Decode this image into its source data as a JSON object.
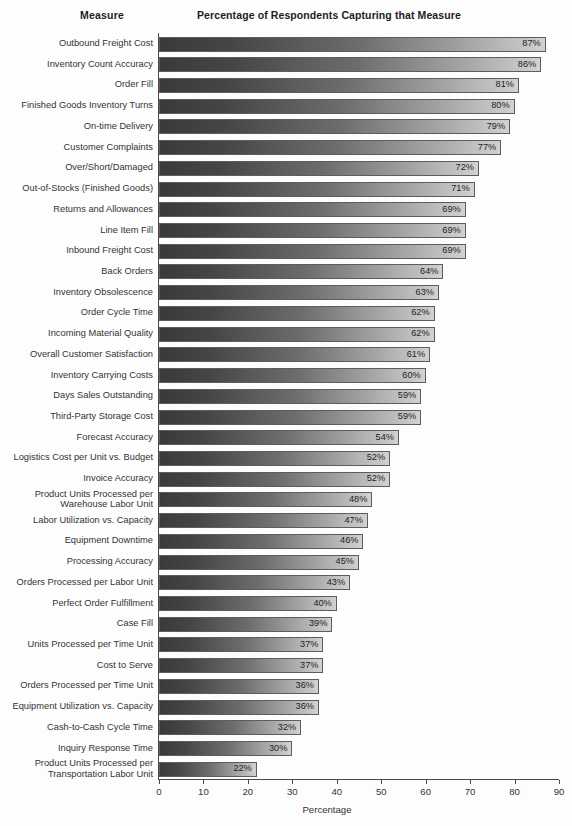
{
  "headers": {
    "measure": "Measure",
    "percentage": "Percentage of Respondents Capturing that Measure"
  },
  "chart_data": {
    "type": "bar",
    "orientation": "horizontal",
    "title": "Percentage of Respondents Capturing that Measure",
    "xlabel": "Percentage",
    "ylabel": "Measure",
    "xlim": [
      0,
      90
    ],
    "xticks": [
      0,
      10,
      20,
      30,
      40,
      50,
      60,
      70,
      80,
      90
    ],
    "grid": false,
    "legend": null,
    "value_suffix": "%",
    "bar_gradient": [
      "#3a3a3a",
      "#d2d2d2"
    ],
    "bar_border": "#5d5d5d",
    "categories": [
      "Outbound Freight Cost",
      "Inventory Count Accuracy",
      "Order Fill",
      "Finished Goods Inventory Turns",
      "On-time Delivery",
      "Customer Complaints",
      "Over/Short/Damaged",
      "Out-of-Stocks (Finished Goods)",
      "Returns and Allowances",
      "Line Item Fill",
      "Inbound Freight Cost",
      "Back Orders",
      "Inventory Obsolescence",
      "Order Cycle Time",
      "Incoming Material Quality",
      "Overall Customer Satisfaction",
      "Inventory Carrying Costs",
      "Days Sales Outstanding",
      "Third-Party Storage Cost",
      "Forecast Accuracy",
      "Logistics Cost per Unit vs. Budget",
      "Invoice Accuracy",
      "Product Units Processed per\nWarehouse Labor Unit",
      "Labor Utilization vs. Capacity",
      "Equipment Downtime",
      "Processing Accuracy",
      "Orders Processed per Labor Unit",
      "Perfect Order Fulfillment",
      "Case Fill",
      "Units Processed per Time Unit",
      "Cost to Serve",
      "Orders Processed per Time  Unit",
      "Equipment Utilization vs. Capacity",
      "Cash-to-Cash Cycle Time",
      "Inquiry Response Time",
      "Product Units Processed per\nTransportation Labor Unit"
    ],
    "values": [
      87,
      86,
      81,
      80,
      79,
      77,
      72,
      71,
      69,
      69,
      69,
      64,
      63,
      62,
      62,
      61,
      60,
      59,
      59,
      54,
      52,
      52,
      48,
      47,
      46,
      45,
      43,
      40,
      39,
      37,
      37,
      36,
      36,
      32,
      30,
      22
    ],
    "value_labels": [
      "87%",
      "86%",
      "81%",
      "80%",
      "79%",
      "77%",
      "72%",
      "71%",
      "69%",
      "69%",
      "69%",
      "64%",
      "63%",
      "62%",
      "62%",
      "61%",
      "60%",
      "59%",
      "59%",
      "54%",
      "52%",
      "52%",
      "48%",
      "47%",
      "46%",
      "45%",
      "43%",
      "40%",
      "39%",
      "37%",
      "37%",
      "36%",
      "36%",
      "32%",
      "30%",
      "22%"
    ]
  }
}
